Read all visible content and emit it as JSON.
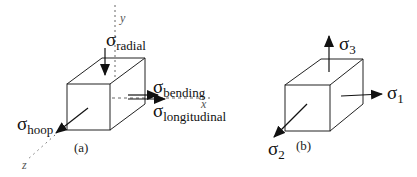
{
  "figure": {
    "panel_a": {
      "caption": "(a)",
      "axes": {
        "x": "x",
        "y": "y",
        "z": "z"
      },
      "stresses": {
        "radial": {
          "symbol": "σ",
          "subscript": "radial"
        },
        "bending": {
          "symbol": "σ",
          "subscript": "bending"
        },
        "longitudinal": {
          "symbol": "σ",
          "subscript": "longitudinal"
        },
        "hoop": {
          "symbol": "σ",
          "subscript": "hoop"
        }
      }
    },
    "panel_b": {
      "caption": "(b)",
      "stresses": {
        "s1": {
          "symbol": "σ",
          "subscript": "1"
        },
        "s2": {
          "symbol": "σ",
          "subscript": "2"
        },
        "s3": {
          "symbol": "σ",
          "subscript": "3"
        }
      }
    },
    "colors": {
      "line": "#222222",
      "axis": "#666666",
      "background": "#ffffff"
    }
  }
}
